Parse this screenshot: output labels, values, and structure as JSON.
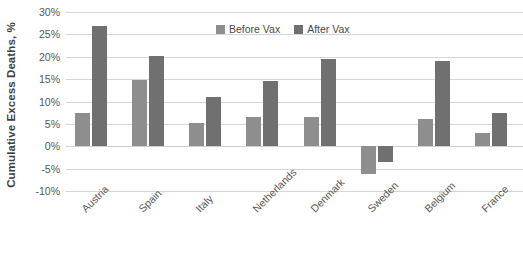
{
  "chart_data": {
    "type": "bar",
    "title": "",
    "xlabel": "",
    "ylabel": "Cumulative Excess Deaths, %",
    "ylim": [
      -10,
      30
    ],
    "ytick_step": 5,
    "ytick_labels": [
      "30%",
      "25%",
      "20%",
      "15%",
      "10%",
      "5%",
      "0%",
      "-5%",
      "-10%"
    ],
    "ytick_values": [
      30,
      25,
      20,
      15,
      10,
      5,
      0,
      -5,
      -10
    ],
    "grid": true,
    "legend_position": "top-center",
    "categories": [
      "Austria",
      "Spain",
      "Italy",
      "Netherlands",
      "Denmark",
      "Sweden",
      "Belgium",
      "France"
    ],
    "series": [
      {
        "name": "Before Vax",
        "color": "#8e8e8e",
        "values": [
          7.4,
          14.8,
          5.3,
          6.6,
          6.5,
          -6.1,
          6.0,
          3.0
        ]
      },
      {
        "name": "After Vax",
        "color": "#707070",
        "values": [
          26.8,
          20.2,
          11.1,
          14.5,
          19.6,
          -3.5,
          19.0,
          7.4
        ]
      }
    ]
  },
  "colors": {
    "before_vax": "#8e8e8e",
    "after_vax": "#707070",
    "gridline": "#d6d6d6",
    "text": "#575757",
    "background": "#ffffff"
  }
}
